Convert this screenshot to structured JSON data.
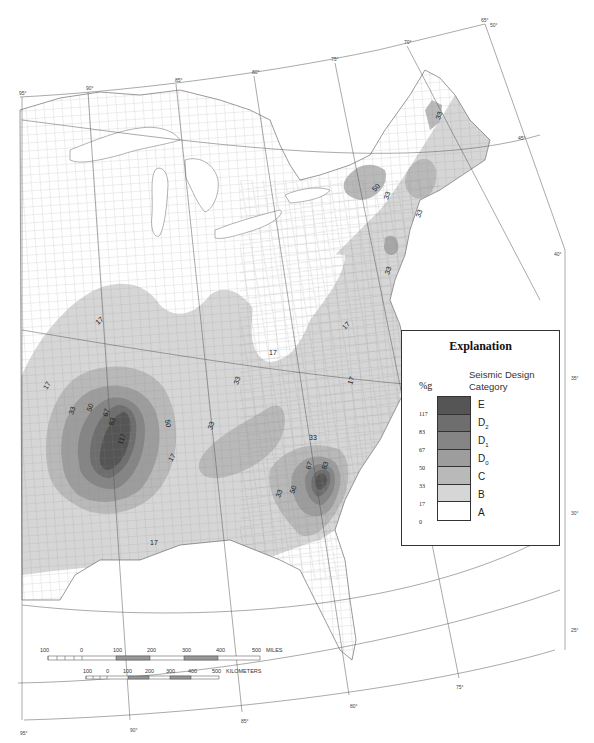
{
  "map": {
    "subject": "Seismic design categories, central and eastern United States",
    "longitude_labels_top": [
      "95°",
      "90°",
      "85°",
      "80°",
      "75°",
      "70°",
      "65°"
    ],
    "latitude_labels_right": [
      "50°",
      "45°",
      "40°",
      "35°",
      "30°",
      "25°"
    ],
    "longitude_labels_bottom": [
      "95°",
      "90°",
      "85°",
      "80°",
      "75°"
    ],
    "contour_labels": {
      "new_madrid": [
        "17",
        "17",
        "33",
        "50",
        "67",
        "83",
        "117",
        "50",
        "33",
        "17"
      ],
      "charleston": [
        "33",
        "50",
        "67",
        "83",
        "33"
      ],
      "northeast": [
        "33",
        "50",
        "33",
        "33",
        "33"
      ],
      "east": [
        "17",
        "17",
        "17",
        "33"
      ],
      "gulf": [
        "17"
      ]
    },
    "colors": {
      "A": "#ffffff",
      "B": "#d6d6d6",
      "C": "#b9b9b9",
      "D0": "#9d9d9d",
      "D1": "#858585",
      "D2": "#6e6e6e",
      "E": "#555555",
      "county_lines": "#7a7a7a",
      "graticule": "#555555"
    }
  },
  "legend": {
    "title": "Explanation",
    "unit_label": "%g",
    "category_header_line1": "Seismic Design",
    "category_header_line2": "Category",
    "categories": [
      {
        "label": "E",
        "sub": "",
        "color": "#555555"
      },
      {
        "label": "D",
        "sub": "2",
        "color": "#6e6e6e"
      },
      {
        "label": "D",
        "sub": "1",
        "color": "#858585"
      },
      {
        "label": "D",
        "sub": "0",
        "color": "#9d9d9d"
      },
      {
        "label": "C",
        "sub": "",
        "color": "#b9b9b9"
      },
      {
        "label": "B",
        "sub": "",
        "color": "#d6d6d6"
      },
      {
        "label": "A",
        "sub": "",
        "color": "#ffffff"
      }
    ],
    "thresholds": [
      "117",
      "83",
      "67",
      "50",
      "33",
      "17",
      "0"
    ]
  },
  "scale_bars": {
    "miles": {
      "ticks": [
        "100",
        "0",
        "100",
        "200",
        "300",
        "400",
        "500"
      ],
      "unit": "MILES"
    },
    "kilometers": {
      "ticks": [
        "100",
        "0",
        "100",
        "200",
        "300",
        "400",
        "500"
      ],
      "unit": "KILOMETERS"
    }
  }
}
